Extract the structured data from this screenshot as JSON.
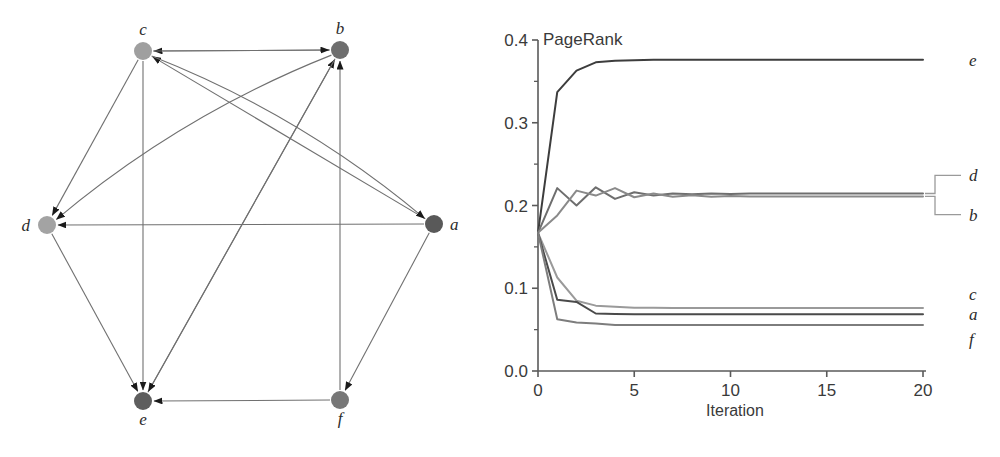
{
  "figure": {
    "panels": [
      "graph-diagram",
      "pagerank-convergence-chart"
    ]
  },
  "graph": {
    "title": "",
    "node_radius": 9,
    "nodes": [
      {
        "id": "a",
        "label": "a",
        "x": 434,
        "y": 224,
        "color": "#595959",
        "label_dx": 16,
        "label_dy": 6
      },
      {
        "id": "b",
        "label": "b",
        "x": 340,
        "y": 50,
        "color": "#6e6e6e",
        "label_dx": 0,
        "label_dy": -16
      },
      {
        "id": "c",
        "label": "c",
        "x": 143,
        "y": 51,
        "color": "#9f9f9f",
        "label_dx": 0,
        "label_dy": -16
      },
      {
        "id": "d",
        "label": "d",
        "x": 47,
        "y": 225,
        "color": "#a3a3a3",
        "label_dx": -17,
        "label_dy": 6
      },
      {
        "id": "e",
        "label": "e",
        "x": 143,
        "y": 401,
        "color": "#5e5e5e",
        "label_dx": 0,
        "label_dy": 24
      },
      {
        "id": "f",
        "label": "f",
        "x": 340,
        "y": 400,
        "color": "#777777",
        "label_dx": 0,
        "label_dy": 24
      }
    ],
    "edges": [
      {
        "from": "b",
        "to": "c",
        "curve": 0
      },
      {
        "from": "a",
        "to": "c",
        "curve": 0
      },
      {
        "from": "c",
        "to": "b",
        "curve": 0
      },
      {
        "from": "e",
        "to": "b",
        "curve": 0
      },
      {
        "from": "f",
        "to": "b",
        "curve": 0
      },
      {
        "from": "c",
        "to": "d",
        "curve": 0
      },
      {
        "from": "b",
        "to": "d",
        "curve": 26
      },
      {
        "from": "a",
        "to": "d",
        "curve": 0
      },
      {
        "from": "c",
        "to": "a",
        "curve": -26
      },
      {
        "from": "c",
        "to": "e",
        "curve": 0
      },
      {
        "from": "d",
        "to": "e",
        "curve": 0
      },
      {
        "from": "b",
        "to": "e",
        "curve": 0
      },
      {
        "from": "f",
        "to": "e",
        "curve": 0
      },
      {
        "from": "a",
        "to": "f",
        "curve": 0
      }
    ],
    "edge_color": "#707070",
    "arrow_color": "#1a1a1a"
  },
  "chart_data": {
    "type": "line",
    "title": "",
    "annotation": "PageRank",
    "xlabel": "Iteration",
    "ylabel": "",
    "xlim": [
      0,
      20
    ],
    "ylim": [
      0.0,
      0.4
    ],
    "xticks": [
      0,
      5,
      10,
      15,
      20
    ],
    "xtick_labels": [
      "0",
      "5",
      "10",
      "15",
      "20"
    ],
    "yticks": [
      0.0,
      0.1,
      0.2,
      0.3,
      0.4
    ],
    "ytick_labels": [
      "0.0",
      "0.1",
      "0.2",
      "0.3",
      "0.4"
    ],
    "yminorticks": [
      0.05,
      0.15,
      0.25,
      0.35
    ],
    "grid": false,
    "legend": "right-labels",
    "x": [
      0,
      1,
      2,
      3,
      4,
      5,
      6,
      7,
      8,
      9,
      10,
      11,
      12,
      13,
      14,
      15,
      16,
      17,
      18,
      19,
      20
    ],
    "series": [
      {
        "name": "e",
        "label": "e",
        "color": "#3d3d3d",
        "values": [
          0.167,
          0.337,
          0.363,
          0.373,
          0.375,
          0.3755,
          0.376,
          0.376,
          0.376,
          0.376,
          0.376,
          0.376,
          0.376,
          0.376,
          0.376,
          0.376,
          0.376,
          0.376,
          0.376,
          0.376,
          0.376
        ]
      },
      {
        "name": "d",
        "label": "d",
        "color": "#6e6e6e",
        "values": [
          0.167,
          0.221,
          0.2,
          0.222,
          0.208,
          0.216,
          0.212,
          0.2145,
          0.2135,
          0.2145,
          0.214,
          0.2145,
          0.2145,
          0.2145,
          0.2145,
          0.2145,
          0.2145,
          0.2145,
          0.2145,
          0.2145,
          0.2145
        ]
      },
      {
        "name": "b",
        "label": "b",
        "color": "#8a8a8a",
        "values": [
          0.167,
          0.188,
          0.218,
          0.212,
          0.221,
          0.21,
          0.2145,
          0.2105,
          0.2125,
          0.2105,
          0.2115,
          0.211,
          0.211,
          0.211,
          0.211,
          0.211,
          0.211,
          0.211,
          0.211,
          0.211,
          0.211
        ]
      },
      {
        "name": "c",
        "label": "c",
        "color": "#9a9a9a",
        "values": [
          0.167,
          0.113,
          0.085,
          0.079,
          0.0775,
          0.0765,
          0.0765,
          0.076,
          0.076,
          0.076,
          0.076,
          0.076,
          0.076,
          0.076,
          0.076,
          0.076,
          0.076,
          0.076,
          0.076,
          0.076,
          0.076
        ]
      },
      {
        "name": "a",
        "label": "a",
        "color": "#4a4a4a",
        "values": [
          0.167,
          0.086,
          0.0835,
          0.0695,
          0.069,
          0.0685,
          0.0685,
          0.0685,
          0.0685,
          0.0685,
          0.0685,
          0.0685,
          0.0685,
          0.0685,
          0.0685,
          0.0685,
          0.0685,
          0.0685,
          0.0685,
          0.0685,
          0.0685
        ]
      },
      {
        "name": "f",
        "label": "f",
        "color": "#7d7d7d",
        "values": [
          0.167,
          0.0625,
          0.0585,
          0.0575,
          0.0555,
          0.0555,
          0.0555,
          0.0555,
          0.0555,
          0.0555,
          0.0555,
          0.0555,
          0.0555,
          0.0555,
          0.0555,
          0.0555,
          0.0555,
          0.0555,
          0.0555,
          0.0555,
          0.0555
        ]
      }
    ],
    "right_labels": [
      {
        "name": "e",
        "label": "e",
        "y_value": 0.376,
        "leader": false
      },
      {
        "name": "d",
        "label": "d",
        "y_value": 0.2145,
        "leader": true,
        "label_y_value": 0.2365
      },
      {
        "name": "b",
        "label": "b",
        "y_value": 0.211,
        "leader": true,
        "label_y_value": 0.189
      },
      {
        "name": "c",
        "label": "c",
        "y_value": 0.076,
        "leader": false,
        "label_y_value": 0.0925
      },
      {
        "name": "a",
        "label": "a",
        "y_value": 0.0685,
        "leader": false,
        "label_y_value": 0.0685
      },
      {
        "name": "f",
        "label": "f",
        "y_value": 0.0555,
        "leader": false,
        "label_y_value": 0.039
      }
    ],
    "axis_color": "#5a5a5a"
  }
}
